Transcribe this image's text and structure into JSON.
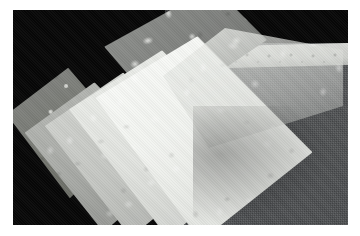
{
  "image": {
    "title": "Fanned stack of embossed patterned paper sheets",
    "kind": "photograph",
    "width_px": 360,
    "height_px": 236,
    "frame": {
      "margin_color": "#ffffff",
      "photo_left_px": 13,
      "photo_top_px": 10,
      "photo_width_px": 335,
      "photo_height_px": 215
    },
    "background": {
      "top_left_color": "#070707",
      "right_cloth_color": "#4d4f51",
      "description": "Black backdrop at top and left, dark grey textured cloth at right"
    },
    "subjects": [
      {
        "name": "lace-trim-strip",
        "description": "Pale horizontal trim band with repeating circular lace motifs across the upper right",
        "color": "#cdcfcb"
      },
      {
        "name": "patterned-grey-sheet-top",
        "description": "Darker grey sheet with light floral/butterfly motifs angled across the upper middle",
        "color": "#7e807d"
      },
      {
        "name": "patterned-dark-sheet-left",
        "description": "Small dark grey sheet with ring motifs at the back left of the fan",
        "color": "#74766f"
      },
      {
        "name": "mid-grey-sheet",
        "description": "Mid grey embossed sheet in the fan",
        "color": "#a6a8a4"
      },
      {
        "name": "light-grey-sheet",
        "description": "Light grey embossed sheet in the fan",
        "color": "#c4c6c2"
      },
      {
        "name": "pale-sheet",
        "description": "Near white embossed sheet in the fan",
        "color": "#e1e3df"
      },
      {
        "name": "white-sheet-front",
        "description": "Brightest white embossed sheet at the front of the fan, filling the lower centre",
        "color": "#f2f4f0"
      },
      {
        "name": "translucent-veil-sheet",
        "description": "Translucent pale sheet laid over the right side reaching the lace strip",
        "color": "#d6d8d4"
      }
    ],
    "palette": {
      "black": "#070707",
      "cloth_grey": "#4d4f51",
      "dark_sheet": "#74766f",
      "mid_sheet": "#a6a8a4",
      "light_sheet": "#c4c6c2",
      "white_sheet": "#f2f4f0",
      "frame_white": "#ffffff"
    }
  }
}
